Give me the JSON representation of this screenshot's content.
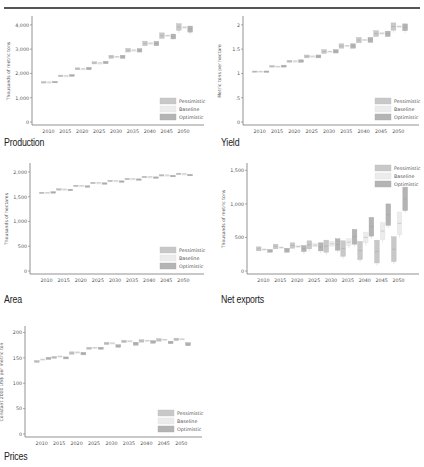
{
  "header": {
    "cut_text": "— — —"
  },
  "legend": {
    "pessimistic": "Pessimistic",
    "baseline": "Baseline",
    "optimistic": "Optimistic"
  },
  "colors": {
    "pessimistic": "#c8c8c8",
    "baseline": "#ececec",
    "optimistic": "#b4b4b4",
    "axis": "#777777",
    "text": "#555555",
    "rule": "#555555"
  },
  "chart_data": [
    {
      "id": "production",
      "type": "bar",
      "title": "Production",
      "xlabel": "",
      "ylabel": "Thousands of metric tons",
      "ylim": [
        0,
        4200
      ],
      "yticks": [
        0,
        1000,
        2000,
        3000,
        4000
      ],
      "ytick_labels": [
        "0",
        "1,000",
        "2,000",
        "3,000",
        "4,000"
      ],
      "categories": [
        "2010",
        "2015",
        "2020",
        "2025",
        "2030",
        "2035",
        "2040",
        "2045",
        "2050"
      ],
      "legend_position": "lower right",
      "series": [
        {
          "name": "Pessimistic",
          "low": [
            1620,
            1870,
            2150,
            2390,
            2620,
            2880,
            3140,
            3440,
            3770
          ],
          "high": [
            1660,
            1930,
            2230,
            2480,
            2750,
            3030,
            3330,
            3670,
            4050
          ]
        },
        {
          "name": "Baseline",
          "low": [
            1640,
            1900,
            2180,
            2420,
            2680,
            2950,
            3230,
            3550,
            3880
          ],
          "high": [
            1650,
            1910,
            2200,
            2440,
            2700,
            2970,
            3260,
            3580,
            3920
          ]
        },
        {
          "name": "Optimistic",
          "low": [
            1620,
            1880,
            2150,
            2400,
            2620,
            2880,
            3140,
            3420,
            3700
          ],
          "high": [
            1670,
            1950,
            2250,
            2500,
            2750,
            3020,
            3320,
            3620,
            3950
          ]
        }
      ]
    },
    {
      "id": "yield",
      "type": "bar",
      "title": "Yield",
      "xlabel": "",
      "ylabel": "Metric tons per hectare",
      "ylim": [
        0,
        2.1
      ],
      "yticks": [
        0,
        0.5,
        1,
        1.5,
        2
      ],
      "ytick_labels": [
        "0",
        ".5",
        "1",
        "1.5",
        "2"
      ],
      "categories": [
        "2010",
        "2015",
        "2020",
        "2025",
        "2030",
        "2035",
        "2040",
        "2045",
        "2050"
      ],
      "legend_position": "lower right",
      "series": [
        {
          "name": "Pessimistic",
          "low": [
            1.03,
            1.13,
            1.23,
            1.32,
            1.41,
            1.52,
            1.63,
            1.76,
            1.89
          ],
          "high": [
            1.05,
            1.16,
            1.27,
            1.38,
            1.49,
            1.61,
            1.74,
            1.88,
            2.04
          ]
        },
        {
          "name": "Baseline",
          "low": [
            1.04,
            1.14,
            1.25,
            1.35,
            1.45,
            1.56,
            1.68,
            1.81,
            1.95
          ],
          "high": [
            1.045,
            1.15,
            1.26,
            1.36,
            1.46,
            1.58,
            1.7,
            1.84,
            1.98
          ]
        },
        {
          "name": "Optimistic",
          "low": [
            1.03,
            1.13,
            1.23,
            1.32,
            1.42,
            1.52,
            1.64,
            1.76,
            1.88
          ],
          "high": [
            1.05,
            1.17,
            1.28,
            1.38,
            1.49,
            1.61,
            1.74,
            1.87,
            2.02
          ]
        }
      ]
    },
    {
      "id": "area",
      "type": "bar",
      "title": "Area",
      "xlabel": "",
      "ylabel": "Thousands of hectares",
      "ylim": [
        0,
        2100
      ],
      "yticks": [
        0,
        500,
        1000,
        1500,
        2000
      ],
      "ytick_labels": [
        "0",
        "500",
        "1,000",
        "1,500",
        "2,000"
      ],
      "categories": [
        "2010",
        "2015",
        "2020",
        "2025",
        "2030",
        "2035",
        "2040",
        "2045",
        "2050"
      ],
      "legend_position": "lower right",
      "series": [
        {
          "name": "Pessimistic",
          "low": [
            1570,
            1640,
            1710,
            1770,
            1810,
            1850,
            1890,
            1920,
            1950
          ],
          "high": [
            1590,
            1660,
            1730,
            1790,
            1830,
            1870,
            1910,
            1945,
            1975
          ]
        },
        {
          "name": "Baseline",
          "low": [
            1580,
            1650,
            1720,
            1780,
            1820,
            1860,
            1900,
            1935,
            1960
          ],
          "high": [
            1585,
            1655,
            1725,
            1785,
            1825,
            1865,
            1905,
            1940,
            1965
          ]
        },
        {
          "name": "Optimistic",
          "low": [
            1580,
            1630,
            1700,
            1760,
            1800,
            1840,
            1880,
            1910,
            1930
          ],
          "high": [
            1600,
            1650,
            1720,
            1780,
            1820,
            1860,
            1900,
            1930,
            1950
          ]
        }
      ]
    },
    {
      "id": "net_exports",
      "type": "bar",
      "title": "Net exports",
      "xlabel": "",
      "ylabel": "Thousands of metric tons",
      "ylim": [
        0,
        1550
      ],
      "yticks": [
        0,
        500,
        1000,
        1500
      ],
      "ytick_labels": [
        "0",
        "500",
        "1,000",
        "1,500"
      ],
      "categories": [
        "2010",
        "2015",
        "2020",
        "2025",
        "2030",
        "2035",
        "2040",
        "2045",
        "2050"
      ],
      "legend_position": "upper right",
      "series": [
        {
          "name": "Pessimistic",
          "low": [
            300,
            330,
            340,
            330,
            280,
            220,
            170,
            120,
            140
          ],
          "high": [
            360,
            400,
            420,
            450,
            460,
            450,
            440,
            460,
            510
          ]
        },
        {
          "name": "Baseline",
          "low": [
            310,
            340,
            350,
            360,
            370,
            380,
            420,
            470,
            540
          ],
          "high": [
            330,
            360,
            380,
            410,
            440,
            480,
            580,
            720,
            880
          ]
        },
        {
          "name": "Optimistic",
          "low": [
            280,
            280,
            290,
            300,
            310,
            400,
            520,
            680,
            900
          ],
          "high": [
            320,
            340,
            380,
            420,
            480,
            620,
            800,
            1000,
            1250
          ]
        }
      ]
    },
    {
      "id": "prices",
      "type": "bar",
      "title": "Prices",
      "xlabel": "",
      "ylabel": "Constant 2000 US$ per metric ton",
      "ylim": [
        0,
        205
      ],
      "yticks": [
        0,
        50,
        100,
        150,
        200
      ],
      "ytick_labels": [
        "0",
        "50",
        "100",
        "150",
        "200"
      ],
      "categories": [
        "2010",
        "2015",
        "2020",
        "2025",
        "2030",
        "2035",
        "2040",
        "2045",
        "2050"
      ],
      "legend_position": "lower right",
      "series": [
        {
          "name": "Pessimistic",
          "low": [
            141,
            149,
            157,
            167,
            176,
            180,
            181,
            183,
            184
          ],
          "high": [
            145,
            153,
            162,
            171,
            181,
            185,
            186,
            188,
            189
          ]
        },
        {
          "name": "Baseline",
          "low": [
            146,
            152,
            160,
            169,
            178,
            182,
            183,
            185,
            186
          ],
          "high": [
            148,
            154,
            162,
            171,
            180,
            184,
            185,
            187,
            188
          ]
        },
        {
          "name": "Optimistic",
          "low": [
            147,
            148,
            156,
            167,
            171,
            175,
            179,
            178,
            174
          ],
          "high": [
            151,
            152,
            161,
            171,
            176,
            181,
            184,
            183,
            180
          ]
        }
      ]
    }
  ]
}
